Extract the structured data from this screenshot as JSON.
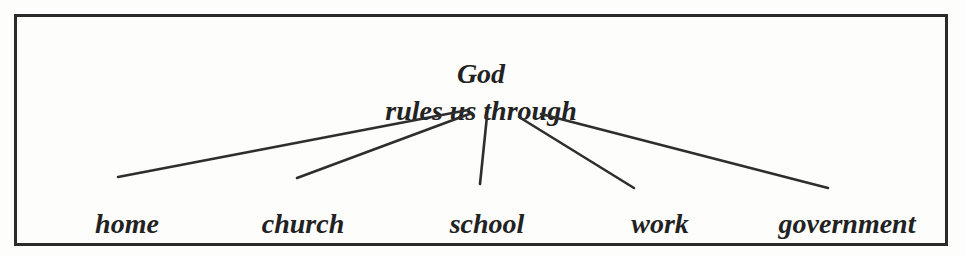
{
  "diagram": {
    "root": {
      "line1": "God",
      "line2": "rules us through"
    },
    "branches": [
      {
        "label": "home"
      },
      {
        "label": "church"
      },
      {
        "label": "school"
      },
      {
        "label": "work"
      },
      {
        "label": "government"
      }
    ],
    "colors": {
      "ink": "#222222",
      "line": "#2e2e2e",
      "border": "#2b2b2b",
      "background": "#fdfdfc"
    }
  }
}
